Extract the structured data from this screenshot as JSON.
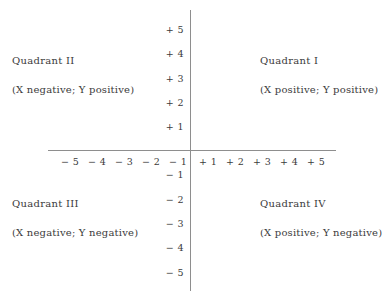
{
  "diagram": {
    "type": "cartesian-coordinate-plane",
    "background_color": "#ffffff",
    "axis_color": "#8e8e8e",
    "text_color": "#3b3b3b",
    "origin": {
      "x": 190,
      "y": 150
    },
    "axes": {
      "x_axis": {
        "label": "",
        "min": -5,
        "max": 5,
        "pixel_start": 48,
        "pixel_end": 336
      },
      "y_axis": {
        "label": "",
        "min": -5,
        "max": 5,
        "pixel_start": 10,
        "pixel_end": 291
      }
    },
    "x_ticks": [
      {
        "label": "− 5",
        "value": -5,
        "px": 70
      },
      {
        "label": "− 4",
        "value": -4,
        "px": 97
      },
      {
        "label": "− 3",
        "value": -3,
        "px": 124
      },
      {
        "label": "− 2",
        "value": -2,
        "px": 151
      },
      {
        "label": "− 1",
        "value": -1,
        "px": 178
      },
      {
        "label": "+ 1",
        "value": 1,
        "px": 208
      },
      {
        "label": "+ 2",
        "value": 2,
        "px": 235
      },
      {
        "label": "+ 3",
        "value": 3,
        "px": 262
      },
      {
        "label": "+ 4",
        "value": 4,
        "px": 289
      },
      {
        "label": "+ 5",
        "value": 5,
        "px": 316
      }
    ],
    "y_ticks": [
      {
        "label": "+ 5",
        "value": 5,
        "px": 29
      },
      {
        "label": "+ 4",
        "value": 4,
        "px": 53
      },
      {
        "label": "+ 3",
        "value": 3,
        "px": 78
      },
      {
        "label": "+ 2",
        "value": 2,
        "px": 102
      },
      {
        "label": "+ 1",
        "value": 1,
        "px": 126
      },
      {
        "label": "− 1",
        "value": -1,
        "px": 174
      },
      {
        "label": "− 2",
        "value": -2,
        "px": 199
      },
      {
        "label": "− 3",
        "value": -3,
        "px": 223
      },
      {
        "label": "− 4",
        "value": -4,
        "px": 247
      },
      {
        "label": "− 5",
        "value": -5,
        "px": 272
      }
    ],
    "quadrants": [
      {
        "id": "quadrant-1",
        "title": "Quadrant I",
        "signs": "(X positive; Y positive)"
      },
      {
        "id": "quadrant-2",
        "title": "Quadrant II",
        "signs": "(X negative; Y positive)"
      },
      {
        "id": "quadrant-3",
        "title": "Quadrant III",
        "signs": "(X negative; Y negative)"
      },
      {
        "id": "quadrant-4",
        "title": "Quadrant IV",
        "signs": "(X positive; Y negative)"
      }
    ]
  }
}
